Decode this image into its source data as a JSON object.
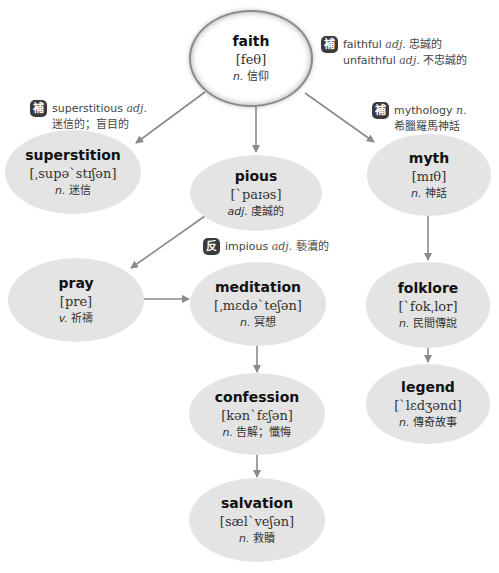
{
  "colors": {
    "node_fill": "#e4e4e4",
    "root_fill": "#ffffff",
    "arrow": "#8a8a8a",
    "badge": "#3a3a3a"
  },
  "nodes": {
    "faith": {
      "word": "faith",
      "ipa": "[feθ]",
      "pos": "n.",
      "meaning": "信仰"
    },
    "superstition": {
      "word": "superstition",
      "ipa": "[ˌsupəˋstɪʃən]",
      "pos": "n.",
      "meaning": "迷信"
    },
    "pious": {
      "word": "pious",
      "ipa": "[ˋpaɪəs]",
      "pos": "adj.",
      "meaning": "虔誠的"
    },
    "myth": {
      "word": "myth",
      "ipa": "[mɪθ]",
      "pos": "n.",
      "meaning": "神話"
    },
    "pray": {
      "word": "pray",
      "ipa": "[pre]",
      "pos": "v.",
      "meaning": "祈禱"
    },
    "meditation": {
      "word": "meditation",
      "ipa": "[ˌmɛdəˋteʃən]",
      "pos": "n.",
      "meaning": "冥想"
    },
    "folklore": {
      "word": "folklore",
      "ipa": "[ˋfokˌlor]",
      "pos": "n.",
      "meaning": "民間傳說"
    },
    "confession": {
      "word": "confession",
      "ipa": "[kənˋfɛʃən]",
      "pos": "n.",
      "meaning": "告解；懺悔"
    },
    "legend": {
      "word": "legend",
      "ipa": "[ˋlɛdʒənd]",
      "pos": "n.",
      "meaning": "傳奇故事"
    },
    "salvation": {
      "word": "salvation",
      "ipa": "[sælˋveʃən]",
      "pos": "n.",
      "meaning": "救贖"
    }
  },
  "notes": {
    "faith": {
      "badge": "補",
      "line1_word": "faithful",
      "line1_pos": "adj.",
      "line1_meaning": "忠誠的",
      "line2_word": "unfaithful",
      "line2_pos": "adj.",
      "line2_meaning": "不忠誠的"
    },
    "superstition": {
      "badge": "補",
      "line1_word": "superstitious",
      "line1_pos": "adj.",
      "line2_meaning": "迷信的；盲目的"
    },
    "myth": {
      "badge": "補",
      "line1_word": "mythology",
      "line1_pos": "n.",
      "line2_meaning": "希臘羅馬神話"
    },
    "pious": {
      "badge": "反",
      "line1_word": "impious",
      "line1_pos": "adj.",
      "line1_meaning": "褻瀆的"
    }
  },
  "edges": [
    {
      "from": "faith",
      "to": "superstition"
    },
    {
      "from": "faith",
      "to": "pious"
    },
    {
      "from": "faith",
      "to": "myth"
    },
    {
      "from": "pious",
      "to": "pray"
    },
    {
      "from": "pray",
      "to": "meditation"
    },
    {
      "from": "meditation",
      "to": "confession"
    },
    {
      "from": "confession",
      "to": "salvation"
    },
    {
      "from": "myth",
      "to": "folklore"
    },
    {
      "from": "folklore",
      "to": "legend"
    }
  ]
}
